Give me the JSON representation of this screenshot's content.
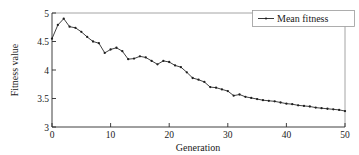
{
  "chart_data": {
    "type": "line",
    "title": "",
    "xlabel": "Generation",
    "ylabel": "Fitness value",
    "xlim": [
      0,
      50
    ],
    "ylim": [
      3,
      5
    ],
    "xticks": [
      "0",
      "10",
      "20",
      "30",
      "40",
      "50"
    ],
    "xtick_values": [
      0,
      10,
      20,
      30,
      40,
      50
    ],
    "yticks": [
      "3",
      "3.5",
      "4",
      "4.5",
      "5"
    ],
    "ytick_values": [
      3,
      3.5,
      4,
      4.5,
      5
    ],
    "grid": false,
    "legend_position": "top-right",
    "legend": [
      "Mean fitness"
    ],
    "marker": "dot",
    "line_color": "#1f1f1f",
    "series": [
      {
        "name": "Mean fitness",
        "x": [
          0,
          1,
          2,
          3,
          4,
          5,
          6,
          7,
          8,
          9,
          10,
          11,
          12,
          13,
          14,
          15,
          16,
          17,
          18,
          19,
          20,
          21,
          22,
          23,
          24,
          25,
          26,
          27,
          28,
          29,
          30,
          31,
          32,
          33,
          34,
          35,
          36,
          37,
          38,
          39,
          40,
          41,
          42,
          43,
          44,
          45,
          46,
          47,
          48,
          49,
          50
        ],
        "values": [
          4.55,
          4.79,
          4.9,
          4.76,
          4.74,
          4.67,
          4.58,
          4.5,
          4.47,
          4.3,
          4.36,
          4.39,
          4.33,
          4.19,
          4.2,
          4.24,
          4.22,
          4.16,
          4.1,
          4.16,
          4.14,
          4.08,
          4.05,
          3.96,
          3.86,
          3.83,
          3.79,
          3.7,
          3.69,
          3.66,
          3.63,
          3.55,
          3.57,
          3.53,
          3.51,
          3.49,
          3.47,
          3.46,
          3.45,
          3.43,
          3.41,
          3.4,
          3.38,
          3.37,
          3.36,
          3.34,
          3.33,
          3.32,
          3.31,
          3.3,
          3.28
        ]
      }
    ]
  },
  "axes": {
    "x_title": "Generation",
    "y_title": "Fitness value"
  },
  "legend": {
    "entries": [
      {
        "label": "Mean fitness"
      }
    ]
  }
}
